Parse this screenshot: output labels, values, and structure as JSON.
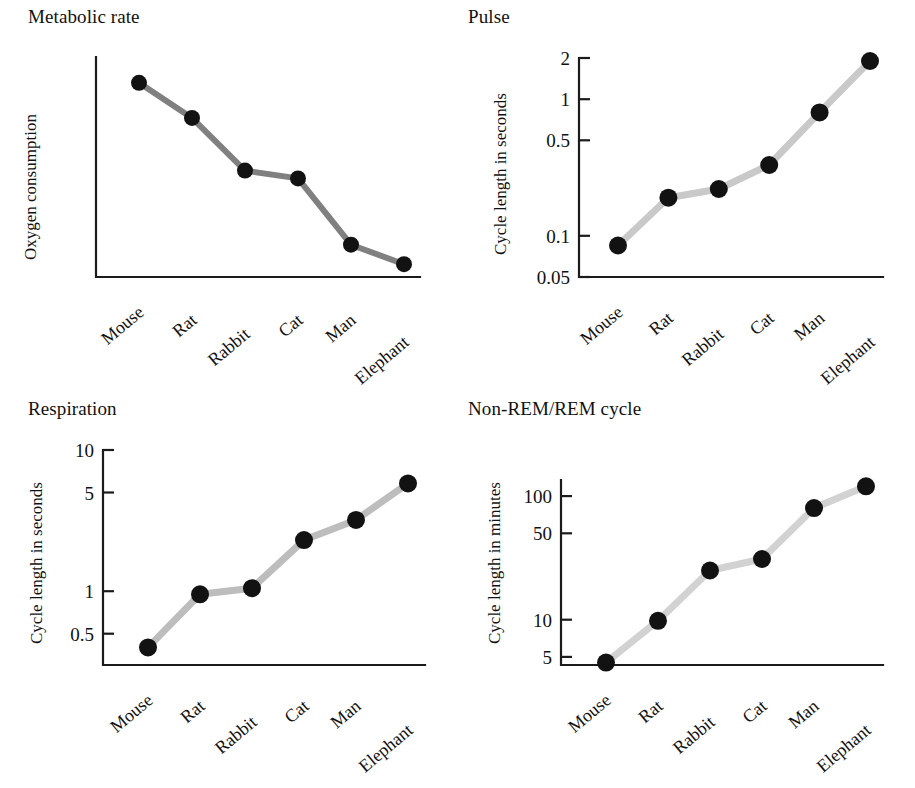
{
  "figure": {
    "categories": [
      "Mouse",
      "Rat",
      "Rabbit",
      "Cat",
      "Man",
      "Elephant"
    ],
    "line_color_dark": "#808080",
    "line_color_light": "#cfcfcf",
    "dot_color": "#121212",
    "axis_color": "#1b1b1b"
  },
  "chart_data": [
    {
      "type": "line",
      "title": "Metabolic rate",
      "xlabel": "",
      "ylabel": "Oxygen consumption",
      "categories": [
        "Mouse",
        "Rat",
        "Rabbit",
        "Cat",
        "Man",
        "Elephant"
      ],
      "values": [
        0.97,
        0.79,
        0.52,
        0.48,
        0.14,
        0.04
      ],
      "yticks": [],
      "ytick_labels": [],
      "yscale": "linear-unlabeled",
      "ylim": [
        0,
        1
      ],
      "grid": false,
      "legend": "none",
      "line_color": "#808080",
      "note": "Y axis unlabeled; values are relative positions read off the plotted curve"
    },
    {
      "type": "line",
      "title": "Pulse",
      "xlabel": "",
      "ylabel": "Cycle length in seconds",
      "categories": [
        "Mouse",
        "Rat",
        "Rabbit",
        "Cat",
        "Man",
        "Elephant"
      ],
      "values": [
        0.085,
        0.19,
        0.22,
        0.33,
        0.8,
        1.9
      ],
      "yticks": [
        0.05,
        0.1,
        0.5,
        1,
        2
      ],
      "ytick_labels": [
        "0.05",
        "0.1",
        "0.5",
        "1",
        "2"
      ],
      "yscale": "log",
      "ylim": [
        0.05,
        2
      ],
      "grid": false,
      "legend": "none",
      "line_color": "#c9c9c9"
    },
    {
      "type": "line",
      "title": "Respiration",
      "xlabel": "",
      "ylabel": "Cycle length in seconds",
      "categories": [
        "Mouse",
        "Rat",
        "Rabbit",
        "Cat",
        "Man",
        "Elephant"
      ],
      "values": [
        0.4,
        0.95,
        1.05,
        2.3,
        3.2,
        5.8
      ],
      "yticks": [
        0.5,
        1,
        5,
        10
      ],
      "ytick_labels": [
        "0.5",
        "1",
        "5",
        "10"
      ],
      "yscale": "log",
      "ylim": [
        0.3,
        10
      ],
      "grid": false,
      "legend": "none",
      "line_color": "#bdbdbd"
    },
    {
      "type": "line",
      "title": "Non-REM/REM cycle",
      "xlabel": "",
      "ylabel": "Cycle length in minutes",
      "categories": [
        "Mouse",
        "Rat",
        "Rabbit",
        "Cat",
        "Man",
        "Elephant"
      ],
      "values": [
        4.5,
        9.8,
        25,
        31,
        80,
        120
      ],
      "yticks": [
        5,
        10,
        50,
        100
      ],
      "ytick_labels": [
        "5",
        "10",
        "50",
        "100"
      ],
      "yscale": "log",
      "ylim": [
        4.3,
        135
      ],
      "grid": false,
      "legend": "none",
      "line_color": "#d2d2d2"
    }
  ]
}
